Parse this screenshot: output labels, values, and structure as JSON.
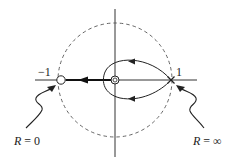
{
  "diagram": {
    "type": "root-locus",
    "axes": {
      "real_axis": true,
      "imag_axis": true
    },
    "unit_circle": {
      "style": "dashed",
      "radius": 1
    },
    "points": {
      "minus_one": {
        "label": "−1",
        "marker": "open-circle"
      },
      "origin": {
        "marker": "open-circle-double"
      },
      "plus_one": {
        "label": "1",
        "marker": "cross"
      }
    },
    "annotations": {
      "left": {
        "text_var": "R",
        "text_rest": " = 0"
      },
      "right": {
        "text_var": "R",
        "text_rest": " = ∞"
      }
    },
    "colors": {
      "stroke": "#222222",
      "dashed": "#555555",
      "background": "#ffffff"
    }
  }
}
